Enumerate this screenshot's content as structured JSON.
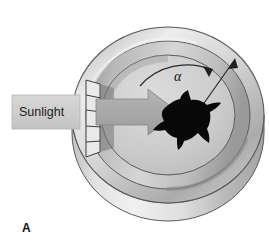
{
  "figure": {
    "panel_label": "A",
    "background_color": "#ffffff",
    "width": 269,
    "height": 251,
    "caption_kind": "orientation-cage-sun-compass-diagram"
  },
  "labels": {
    "sunlight": "Sunlight",
    "angle_symbol": "α"
  },
  "colors": {
    "background": "#ffffff",
    "outline": "#4a4a4a",
    "outline_dark": "#3a3a3a",
    "cage_outer_light": "#e8e8e8",
    "cage_outer_mid": "#c9c9c9",
    "cage_outer_dark": "#a6a6a6",
    "cage_rim_light": "#efefef",
    "cage_rim_dark": "#9c9c9c",
    "cage_floor_light": "#d9d9d9",
    "cage_floor_dark": "#b4b4b4",
    "sunlight_bar": "#cccccc",
    "sunlight_bar_edge": "#b0b0b0",
    "beam_arrow": "#a8a8a8",
    "beam_arrow_edge": "#8a8a8a",
    "bird_silhouette": "#080808",
    "text": "#1c1c1c",
    "angle_arrow": "#2b2b2b"
  },
  "elements": {
    "cage": {
      "name": "circular orientation cage",
      "view": "three-quarter perspective cylinder",
      "center_x": 168,
      "center_y": 115,
      "outer_rx": 96,
      "outer_ry": 88,
      "rim_rx": 80,
      "rim_ry": 72,
      "floor_rx": 66,
      "floor_ry": 59,
      "wall_depth": 42
    },
    "slit": {
      "name": "entrance slit in cage wall",
      "x": 76,
      "y": 80,
      "width": 18,
      "height": 76,
      "segments": 5
    },
    "sunlight_bar": {
      "x": 12,
      "y": 95,
      "width": 68,
      "height": 34
    },
    "beam_arrow": {
      "tail_x": 80,
      "tip_x": 176,
      "center_y": 112,
      "shaft_half_height": 13,
      "head_half_height": 23,
      "head_length": 30
    },
    "bird": {
      "name": "bird silhouette in cage center",
      "center_x": 187,
      "center_y": 122,
      "facing": "right",
      "wingspan": 56
    },
    "angle_arc": {
      "name": "angle alpha arc arrow",
      "center_x": 186,
      "center_y": 122,
      "radius_x": 56,
      "radius_y": 52,
      "start_angle_deg": 223,
      "end_angle_deg": 310,
      "label_position": {
        "x": 180,
        "y": 81
      }
    },
    "radial_arrow": {
      "name": "heading direction arrow",
      "from_x": 186,
      "from_y": 122,
      "to_x": 232,
      "to_y": 63
    }
  }
}
